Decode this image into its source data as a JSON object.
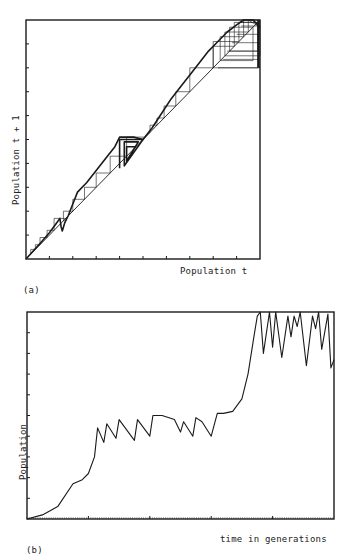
{
  "chart_data": [
    {
      "id": "a",
      "type": "line",
      "subtype": "cobweb",
      "panel_label": "(a)",
      "title": "",
      "xlabel": "Population t",
      "ylabel": "Population t + 1",
      "xlim": [
        0,
        1
      ],
      "ylim": [
        0,
        1
      ],
      "grid": false,
      "x_ticks_count": 9,
      "y_ticks_count": 9,
      "tick_labels": "none",
      "series": [
        {
          "name": "map curve",
          "points": [
            [
              0,
              0
            ],
            [
              0.06,
              0.065
            ],
            [
              0.1,
              0.11
            ],
            [
              0.13,
              0.15
            ],
            [
              0.145,
              0.17
            ],
            [
              0.15,
              0.135
            ],
            [
              0.155,
              0.117
            ],
            [
              0.165,
              0.15
            ],
            [
              0.18,
              0.18
            ],
            [
              0.2,
              0.23
            ],
            [
              0.22,
              0.28
            ],
            [
              0.26,
              0.32
            ],
            [
              0.3,
              0.37
            ],
            [
              0.34,
              0.42
            ],
            [
              0.38,
              0.47
            ],
            [
              0.4,
              0.51
            ],
            [
              0.43,
              0.51
            ],
            [
              0.46,
              0.51
            ],
            [
              0.5,
              0.5
            ],
            [
              0.54,
              0.55
            ],
            [
              0.58,
              0.61
            ],
            [
              0.62,
              0.67
            ],
            [
              0.66,
              0.72
            ],
            [
              0.7,
              0.77
            ],
            [
              0.74,
              0.82
            ],
            [
              0.78,
              0.87
            ],
            [
              0.82,
              0.91
            ],
            [
              0.86,
              0.95
            ],
            [
              0.9,
              0.98
            ],
            [
              0.93,
              1.0
            ],
            [
              0.97,
              1.0
            ],
            [
              0.985,
              0.985
            ],
            [
              1.0,
              0.97
            ]
          ]
        },
        {
          "name": "diagonal y=x",
          "points": [
            [
              0,
              0
            ],
            [
              1,
              1
            ]
          ]
        },
        {
          "name": "box-region dense orbit",
          "points": [
            [
              0.4,
              0.38
            ],
            [
              0.4,
              0.5
            ],
            [
              0.5,
              0.5
            ],
            [
              0.42,
              0.39
            ],
            [
              0.42,
              0.49
            ],
            [
              0.48,
              0.49
            ],
            [
              0.43,
              0.41
            ],
            [
              0.43,
              0.47
            ],
            [
              0.47,
              0.47
            ]
          ]
        },
        {
          "name": "cobweb trajectory",
          "points": [
            [
              0.02,
              0.02
            ],
            [
              0.02,
              0.04
            ],
            [
              0.04,
              0.04
            ],
            [
              0.04,
              0.06
            ],
            [
              0.06,
              0.06
            ],
            [
              0.06,
              0.09
            ],
            [
              0.09,
              0.09
            ],
            [
              0.09,
              0.12
            ],
            [
              0.12,
              0.12
            ],
            [
              0.12,
              0.17
            ],
            [
              0.17,
              0.17
            ],
            [
              0.17,
              0.16
            ],
            [
              0.16,
              0.16
            ],
            [
              0.16,
              0.2
            ],
            [
              0.2,
              0.2
            ],
            [
              0.2,
              0.25
            ],
            [
              0.25,
              0.25
            ],
            [
              0.25,
              0.3
            ],
            [
              0.3,
              0.3
            ],
            [
              0.3,
              0.36
            ],
            [
              0.36,
              0.36
            ],
            [
              0.36,
              0.43
            ],
            [
              0.43,
              0.43
            ],
            [
              0.43,
              0.51
            ],
            [
              0.51,
              0.51
            ],
            [
              0.53,
              0.53
            ],
            [
              0.53,
              0.56
            ],
            [
              0.56,
              0.56
            ],
            [
              0.56,
              0.59
            ],
            [
              0.59,
              0.59
            ],
            [
              0.59,
              0.64
            ],
            [
              0.64,
              0.64
            ],
            [
              0.64,
              0.7
            ],
            [
              0.7,
              0.7
            ],
            [
              0.7,
              0.8
            ],
            [
              0.8,
              0.8
            ],
            [
              0.8,
              0.91
            ],
            [
              0.91,
              0.91
            ],
            [
              0.91,
              0.99
            ],
            [
              0.99,
              0.99
            ],
            [
              0.99,
              0.8
            ],
            [
              0.8,
              0.8
            ],
            [
              0.8,
              0.89
            ],
            [
              0.89,
              0.89
            ],
            [
              0.89,
              0.99
            ],
            [
              0.99,
              0.99
            ],
            [
              0.99,
              0.87
            ],
            [
              0.87,
              0.87
            ],
            [
              0.87,
              0.97
            ],
            [
              0.97,
              0.97
            ],
            [
              0.97,
              0.83
            ],
            [
              0.83,
              0.83
            ],
            [
              0.83,
              0.93
            ],
            [
              0.93,
              0.93
            ],
            [
              0.93,
              1.0
            ],
            [
              1.0,
              1.0
            ],
            [
              1.0,
              0.85
            ],
            [
              0.85,
              0.85
            ],
            [
              0.85,
              0.95
            ],
            [
              0.95,
              0.95
            ],
            [
              0.95,
              1.0
            ],
            [
              1.0,
              0.97
            ]
          ]
        }
      ]
    },
    {
      "id": "b",
      "type": "line",
      "panel_label": "(b)",
      "title": "",
      "xlabel": "time in generations",
      "ylabel": "Population",
      "xlim": [
        0,
        1
      ],
      "ylim": [
        0,
        1
      ],
      "grid": false,
      "x_major_ticks_count": 4,
      "y_ticks_count": 9,
      "tick_labels": "none",
      "series": [
        {
          "name": "population",
          "points": [
            [
              0,
              0
            ],
            [
              0.05,
              0.02
            ],
            [
              0.1,
              0.06
            ],
            [
              0.15,
              0.17
            ],
            [
              0.18,
              0.19
            ],
            [
              0.2,
              0.22
            ],
            [
              0.22,
              0.3
            ],
            [
              0.23,
              0.44
            ],
            [
              0.25,
              0.37
            ],
            [
              0.26,
              0.46
            ],
            [
              0.29,
              0.39
            ],
            [
              0.3,
              0.48
            ],
            [
              0.35,
              0.38
            ],
            [
              0.36,
              0.48
            ],
            [
              0.4,
              0.4
            ],
            [
              0.41,
              0.5
            ],
            [
              0.44,
              0.5
            ],
            [
              0.48,
              0.48
            ],
            [
              0.5,
              0.42
            ],
            [
              0.51,
              0.47
            ],
            [
              0.54,
              0.4
            ],
            [
              0.55,
              0.49
            ],
            [
              0.57,
              0.47
            ],
            [
              0.6,
              0.4
            ],
            [
              0.62,
              0.51
            ],
            [
              0.64,
              0.51
            ],
            [
              0.67,
              0.52
            ],
            [
              0.7,
              0.58
            ],
            [
              0.72,
              0.7
            ],
            [
              0.74,
              0.89
            ],
            [
              0.75,
              0.98
            ],
            [
              0.76,
              1.0
            ],
            [
              0.77,
              0.8
            ],
            [
              0.79,
              1.0
            ],
            [
              0.8,
              0.83
            ],
            [
              0.81,
              1.0
            ],
            [
              0.83,
              0.78
            ],
            [
              0.85,
              0.98
            ],
            [
              0.86,
              0.88
            ],
            [
              0.87,
              0.98
            ],
            [
              0.88,
              0.93
            ],
            [
              0.89,
              1.0
            ],
            [
              0.91,
              0.74
            ],
            [
              0.93,
              0.98
            ],
            [
              0.94,
              0.92
            ],
            [
              0.95,
              1.0
            ],
            [
              0.96,
              0.82
            ],
            [
              0.98,
              0.99
            ],
            [
              0.99,
              0.73
            ],
            [
              1.0,
              0.77
            ]
          ]
        }
      ]
    }
  ],
  "panel_a": {
    "label": "(a)",
    "xlabel": "Population t",
    "ylabel": "Population t + 1"
  },
  "panel_b": {
    "label": "(b)",
    "xlabel": "time in generations",
    "ylabel": "Population"
  }
}
